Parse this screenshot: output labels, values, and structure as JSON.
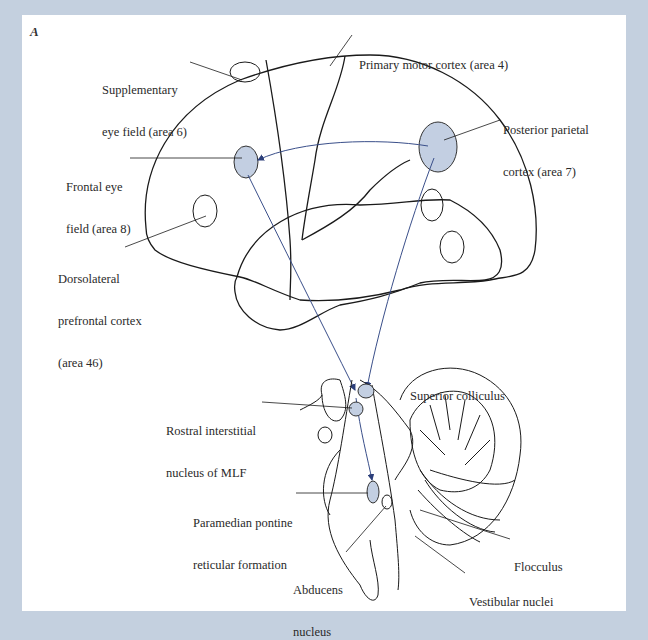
{
  "figure": {
    "panel_letter": "A",
    "colors": {
      "background_border": "#c4d0df",
      "panel": "#ffffff",
      "outline": "#1a1a1a",
      "highlight_fill": "#c3cfe2",
      "pathway": "#3a4f8a"
    },
    "labels": {
      "supplementary_eye_field": {
        "line1": "Supplementary",
        "line2": "eye field (area 6)"
      },
      "primary_motor_cortex": {
        "line1": "Primary motor cortex (area 4)"
      },
      "posterior_parietal_cortex": {
        "line1": "Posterior parietal",
        "line2": "cortex (area 7)"
      },
      "frontal_eye_field": {
        "line1": "Frontal eye",
        "line2": "field (area 8)"
      },
      "dorsolateral_prefrontal_cortex": {
        "line1": "Dorsolateral",
        "line2": "prefrontal cortex",
        "line3": "(area 46)"
      },
      "superior_colliculus": {
        "line1": "Superior colliculus"
      },
      "rostral_interstitial_nucleus": {
        "line1": "Rostral interstitial",
        "line2": "nucleus of MLF"
      },
      "paramedian_pontine_reticular_formation": {
        "line1": "Paramedian pontine",
        "line2": "reticular formation"
      },
      "flocculus": {
        "line1": "Flocculus"
      },
      "abducens_nucleus": {
        "line1": "Abducens",
        "line2": "nucleus"
      },
      "vestibular_nuclei": {
        "line1": "Vestibular nuclei"
      }
    }
  }
}
